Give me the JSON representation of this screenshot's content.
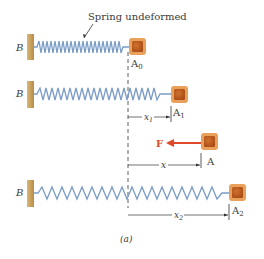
{
  "diagram": {
    "caption": "Spring undeformed",
    "panel_label": "(a)",
    "wall_label": "B",
    "force_label": "F",
    "rows": [
      {
        "block_label": "A",
        "block_sub": "0"
      },
      {
        "block_label": "A",
        "block_sub": "1",
        "dim_label": "x",
        "dim_sub": "1"
      },
      {
        "block_label": "A",
        "block_sub": "",
        "dim_label": "x",
        "dim_sub": ""
      },
      {
        "block_label": "A",
        "block_sub": "2",
        "dim_label": "x",
        "dim_sub": "2"
      }
    ],
    "colors": {
      "spring": "#7a9cc6",
      "wall": "#c9a25c",
      "block_outer": "#e08a3c",
      "block_inner": "#b8561e",
      "force_arrow": "#e04a2a",
      "text": "#333333"
    }
  }
}
